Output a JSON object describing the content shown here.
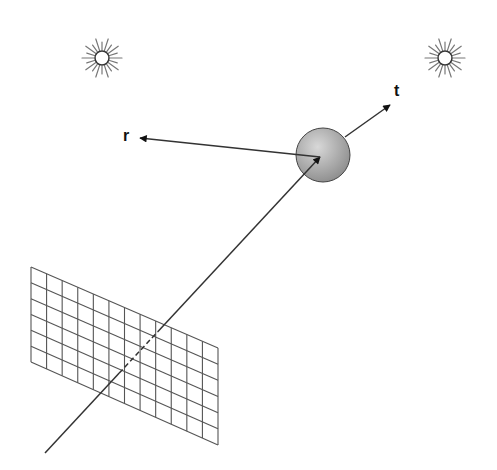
{
  "diagram": {
    "title": "",
    "labels": {
      "reflected_ray": "r",
      "transmitted_ray": "t"
    },
    "elements": {
      "light_sources": [
        {
          "name": "light-source-left",
          "cx": 102,
          "cy": 58
        },
        {
          "name": "light-source-right",
          "cx": 445,
          "cy": 58
        }
      ],
      "sphere": {
        "cx": 323,
        "cy": 155,
        "r": 27,
        "fill_light": "#d8d8d8",
        "fill_dark": "#8c8c8c"
      },
      "image_plane": {
        "columns": 12,
        "rows": 6,
        "corners": {
          "tl": [
            31,
            267
          ],
          "tr": [
            218,
            348
          ],
          "br": [
            218,
            445
          ],
          "bl": [
            31,
            362
          ]
        }
      },
      "primary_ray": {
        "from": [
          45,
          453
        ],
        "to": [
          320,
          157
        ]
      },
      "reflected_ray": {
        "from": [
          320,
          157
        ],
        "to": [
          140,
          138
        ]
      },
      "transmitted_ray": {
        "from": [
          345,
          137
        ],
        "to": [
          390,
          105
        ]
      }
    },
    "colors": {
      "line": "#333333",
      "grid": "#555555",
      "sun": "#777777"
    }
  }
}
